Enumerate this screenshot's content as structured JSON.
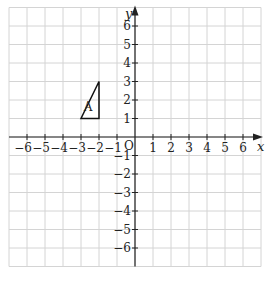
{
  "chart_data": {
    "type": "coordinate-grid",
    "xlabel": "x",
    "ylabel": "y",
    "origin_label": "O",
    "xlim": [
      -7,
      7
    ],
    "ylim": [
      -7,
      7
    ],
    "x_ticks": [
      -6,
      -5,
      -4,
      -3,
      -2,
      -1,
      1,
      2,
      3,
      4,
      5,
      6
    ],
    "y_ticks": [
      -6,
      -5,
      -4,
      -3,
      -2,
      -1,
      1,
      2,
      3,
      4,
      5,
      6
    ],
    "grid": true,
    "shapes": [
      {
        "name": "A",
        "type": "triangle",
        "vertices": [
          [
            -3,
            1
          ],
          [
            -2,
            1
          ],
          [
            -2,
            3
          ]
        ],
        "label_pos": [
          -2.6,
          1.6
        ]
      }
    ]
  },
  "colors": {
    "grid": "#d4d4d4",
    "axis": "#222222",
    "shape": "#111111"
  }
}
